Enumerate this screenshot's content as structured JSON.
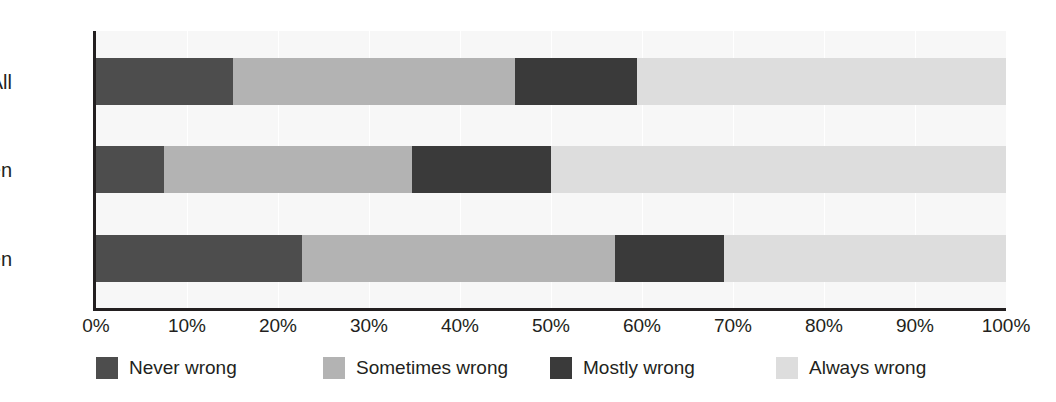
{
  "chart_data": {
    "type": "bar",
    "orientation": "horizontal",
    "stacked": true,
    "stack_mode": "percent",
    "title": "",
    "xlabel": "",
    "ylabel": "",
    "xlim": [
      0,
      100
    ],
    "grid": true,
    "grid_axis": "x",
    "legend_position": "bottom",
    "categories": [
      "All",
      "Women",
      "Men"
    ],
    "tick_labels": [
      "0%",
      "10%",
      "20%",
      "30%",
      "40%",
      "50%",
      "60%",
      "70%",
      "80%",
      "90%",
      "100%"
    ],
    "tick_values": [
      0,
      10,
      20,
      30,
      40,
      50,
      60,
      70,
      80,
      90,
      100
    ],
    "series": [
      {
        "name": "Never wrong",
        "color": "#4d4d4d",
        "values": [
          15.0,
          7.5,
          22.6
        ]
      },
      {
        "name": "Sometimes wrong",
        "color": "#b3b3b3",
        "values": [
          31.0,
          27.2,
          34.4
        ]
      },
      {
        "name": "Mostly wrong",
        "color": "#3a3a3a",
        "values": [
          13.5,
          15.3,
          12.0
        ]
      },
      {
        "name": "Always wrong",
        "color": "#dddddd",
        "values": [
          40.5,
          50.0,
          31.0
        ]
      }
    ]
  },
  "colors": {
    "axis": "#231f20",
    "plot_background": "#f7f7f7",
    "gridline": "#ffffff",
    "text": "#231f20"
  }
}
